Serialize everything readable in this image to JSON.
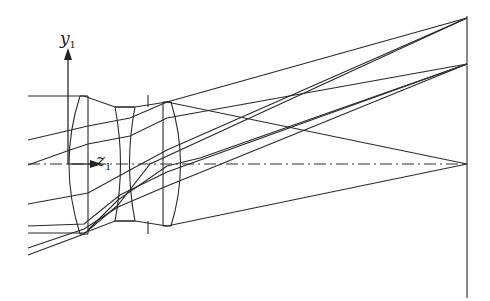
{
  "diagram": {
    "type": "optical-ray-trace",
    "labels": {
      "y_axis": "y",
      "y_sub": "1",
      "z_axis": "z",
      "z_sub": "1"
    },
    "elements": [
      "lens-1 (biconvex)",
      "lens-2 (biconcave)",
      "aperture stop",
      "lens-3 (biconvex)",
      "image plane"
    ],
    "image_points": [
      "top field",
      "mid field",
      "on-axis"
    ],
    "colors": {
      "line": "#2a2a2a",
      "background": "#ffffff"
    }
  }
}
